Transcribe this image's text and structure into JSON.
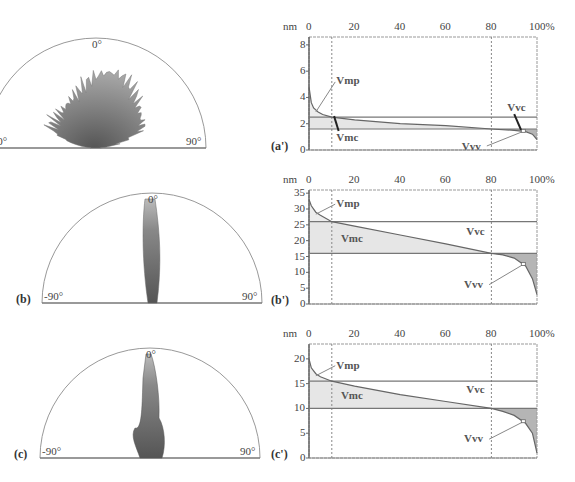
{
  "figure": {
    "panels": [
      {
        "id": "a",
        "label": "(a)",
        "type": "polar",
        "angle_labels": [
          "-90°",
          "0°",
          "90°"
        ],
        "shape": "broad"
      },
      {
        "id": "b",
        "label": "(b)",
        "type": "polar",
        "angle_labels": [
          "-90°",
          "0°",
          "90°"
        ],
        "shape": "narrow"
      },
      {
        "id": "c",
        "label": "(c)",
        "type": "polar",
        "angle_labels": [
          "-90°",
          "0°",
          "90°"
        ],
        "shape": "narrow-with-base"
      }
    ]
  },
  "chart_data": [
    {
      "id": "a'",
      "label": "(a')",
      "type": "area",
      "title": "",
      "xlabel": "%",
      "ylabel": "nm",
      "x_ticks": [
        "0",
        "20",
        "40",
        "60",
        "80",
        "100%"
      ],
      "y_ticks": [
        "0",
        "2",
        "4",
        "6",
        "8"
      ],
      "xlim": [
        0,
        100
      ],
      "ylim": [
        0,
        8.6
      ],
      "vertical_dotted_at": [
        10,
        80
      ],
      "horizontal_lines": [
        2.5,
        1.6
      ],
      "annotations": [
        "Vmp",
        "Vmc",
        "Vvc",
        "Vvv"
      ],
      "curve": {
        "x": [
          0,
          1,
          2,
          4,
          6,
          10,
          20,
          40,
          60,
          80,
          90,
          95,
          98,
          100
        ],
        "y": [
          4.8,
          3.6,
          3.2,
          2.9,
          2.7,
          2.5,
          2.3,
          2.0,
          1.85,
          1.6,
          1.5,
          1.4,
          1.2,
          0.8
        ]
      }
    },
    {
      "id": "b'",
      "label": "(b')",
      "type": "area",
      "title": "",
      "xlabel": "%",
      "ylabel": "nm",
      "x_ticks": [
        "0",
        "20",
        "40",
        "60",
        "80",
        "100%"
      ],
      "y_ticks": [
        "0",
        "5",
        "10",
        "15",
        "20",
        "25",
        "30",
        "35"
      ],
      "xlim": [
        0,
        100
      ],
      "ylim": [
        0,
        36
      ],
      "vertical_dotted_at": [
        10,
        80
      ],
      "horizontal_lines": [
        26,
        16
      ],
      "annotations": [
        "Vmp",
        "Vmc",
        "Vvc",
        "Vvv"
      ],
      "curve": {
        "x": [
          0,
          1,
          3,
          5,
          10,
          20,
          40,
          60,
          80,
          85,
          90,
          95,
          98,
          100
        ],
        "y": [
          33,
          31,
          29,
          28,
          26,
          24.6,
          21.8,
          19,
          16,
          15.5,
          14.5,
          12,
          8,
          3
        ]
      }
    },
    {
      "id": "c'",
      "label": "(c')",
      "type": "area",
      "title": "",
      "xlabel": "%",
      "ylabel": "nm",
      "x_ticks": [
        "0",
        "20",
        "40",
        "60",
        "80",
        "100%"
      ],
      "y_ticks": [
        "0",
        "5",
        "10",
        "15",
        "20"
      ],
      "xlim": [
        0,
        100
      ],
      "ylim": [
        0,
        23
      ],
      "vertical_dotted_at": [
        10,
        80
      ],
      "horizontal_lines": [
        15.5,
        10
      ],
      "annotations": [
        "Vmp",
        "Vmc",
        "Vvc",
        "Vvv"
      ],
      "curve": {
        "x": [
          0,
          1,
          3,
          5,
          10,
          20,
          40,
          60,
          80,
          85,
          90,
          95,
          98,
          100
        ],
        "y": [
          20,
          18.2,
          17,
          16.4,
          15.5,
          14.5,
          12.8,
          11.4,
          10,
          9.4,
          8.6,
          7,
          5,
          1
        ]
      }
    }
  ]
}
